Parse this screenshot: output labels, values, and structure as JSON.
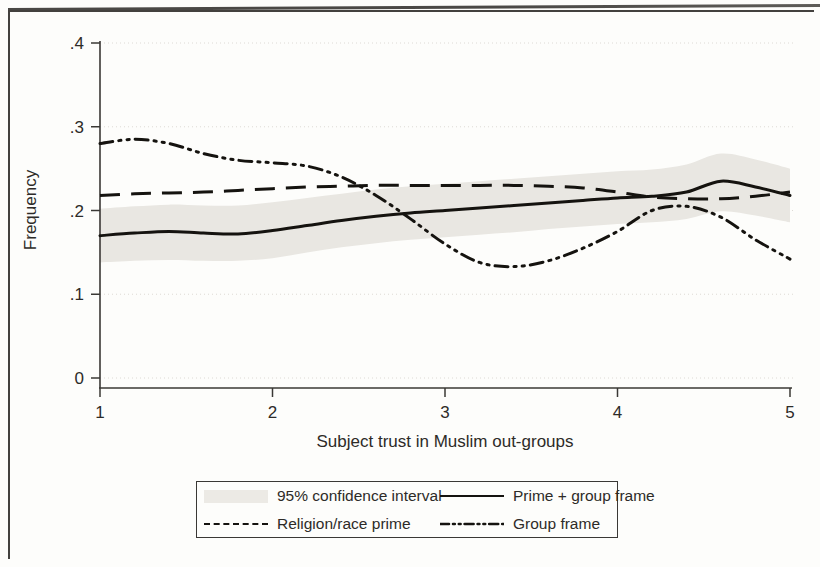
{
  "figure": {
    "background_color": "#fdfdfb",
    "ink_color": "#15130f",
    "band_color": "#e9e7e2"
  },
  "chart_data": {
    "type": "line",
    "title": "",
    "subtitle": "",
    "xlabel": "Subject trust in Muslim out-groups",
    "ylabel": "Frequency",
    "xlim": [
      1,
      5
    ],
    "ylim": [
      0,
      0.4
    ],
    "xticks": [
      1,
      2,
      3,
      4,
      5
    ],
    "xtick_labels": [
      "1",
      "2",
      "3",
      "4",
      "5"
    ],
    "yticks": [
      0,
      0.1,
      0.2,
      0.3,
      0.4
    ],
    "ytick_labels": [
      "0",
      ".1",
      ".2",
      ".3",
      ".4"
    ],
    "grid": "horizontal-dotted-light",
    "legend_position": "below-plot-centered",
    "legend_entries": [
      {
        "label": "95% confidence interval",
        "style": "shaded-band"
      },
      {
        "label": "Prime + group frame",
        "style": "solid"
      },
      {
        "label": "Religion/race prime",
        "style": "dashed"
      },
      {
        "label": "Group frame",
        "style": "dash-dot-dot"
      }
    ],
    "x": [
      1.0,
      1.2,
      1.4,
      1.6,
      1.8,
      2.0,
      2.2,
      2.4,
      2.6,
      2.8,
      3.0,
      3.2,
      3.4,
      3.6,
      3.8,
      4.0,
      4.2,
      4.4,
      4.6,
      4.8,
      5.0
    ],
    "series": [
      {
        "name": "Prime + group frame",
        "style": "solid",
        "values": [
          0.17,
          0.173,
          0.175,
          0.173,
          0.172,
          0.176,
          0.182,
          0.188,
          0.193,
          0.197,
          0.2,
          0.203,
          0.206,
          0.209,
          0.212,
          0.215,
          0.217,
          0.222,
          0.235,
          0.228,
          0.218
        ]
      },
      {
        "name": "Religion/race prime",
        "style": "dashed",
        "values": [
          0.218,
          0.22,
          0.221,
          0.222,
          0.224,
          0.226,
          0.228,
          0.229,
          0.23,
          0.23,
          0.23,
          0.23,
          0.23,
          0.229,
          0.227,
          0.222,
          0.216,
          0.214,
          0.214,
          0.217,
          0.222
        ]
      },
      {
        "name": "Group frame",
        "style": "dash-dot-dot",
        "values": [
          0.28,
          0.285,
          0.28,
          0.268,
          0.26,
          0.257,
          0.253,
          0.24,
          0.218,
          0.19,
          0.16,
          0.138,
          0.133,
          0.14,
          0.155,
          0.175,
          0.2,
          0.205,
          0.192,
          0.165,
          0.142
        ]
      }
    ],
    "confidence_band": {
      "name": "95% confidence interval",
      "for_series": "Prime + group frame",
      "lower": [
        0.138,
        0.14,
        0.141,
        0.14,
        0.14,
        0.143,
        0.15,
        0.156,
        0.161,
        0.165,
        0.168,
        0.171,
        0.174,
        0.178,
        0.181,
        0.184,
        0.186,
        0.19,
        0.199,
        0.194,
        0.186
      ],
      "upper": [
        0.202,
        0.205,
        0.207,
        0.206,
        0.206,
        0.21,
        0.215,
        0.22,
        0.225,
        0.229,
        0.232,
        0.235,
        0.238,
        0.241,
        0.244,
        0.247,
        0.249,
        0.255,
        0.268,
        0.261,
        0.25
      ]
    }
  }
}
